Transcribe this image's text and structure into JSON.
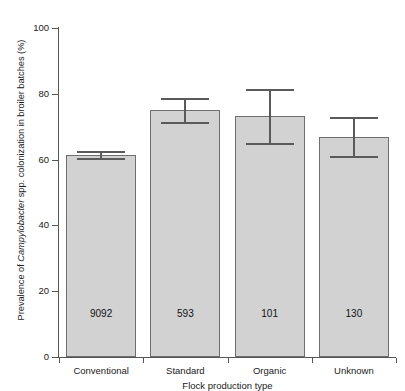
{
  "chart_data": {
    "type": "bar",
    "title": "",
    "subtitle": "",
    "xlabel": "Flock production type",
    "ylabel_prefix": "Prevalence of ",
    "ylabel_italic": "Campylobacter",
    "ylabel_suffix": " spp. colonization in broiler batches (%)",
    "ylabel": "Prevalence of Campylobacter spp. colonization in broiler batches (%)",
    "categories": [
      "Conventional",
      "Standard",
      "Organic",
      "Unknown"
    ],
    "values": [
      61.5,
      75.2,
      73.3,
      67.0
    ],
    "error_low": [
      60.4,
      71.5,
      65.0,
      61.0
    ],
    "error_high": [
      62.5,
      78.8,
      81.5,
      72.8
    ],
    "sample_sizes": [
      "9092",
      "593",
      "101",
      "130"
    ],
    "ylim": [
      0,
      100
    ],
    "yticks": [
      0,
      20,
      40,
      60,
      80,
      100
    ],
    "ytick_labels": [
      "0",
      "20",
      "40",
      "60",
      "80",
      "100"
    ],
    "grid": false,
    "legend": "none",
    "bar_fill_color": "#d2d2d2",
    "bar_edge_color": "#6e6e6e",
    "error_bar_color": "#5a5a5a",
    "axis_color": "#555555",
    "background_color": "#ffffff"
  }
}
